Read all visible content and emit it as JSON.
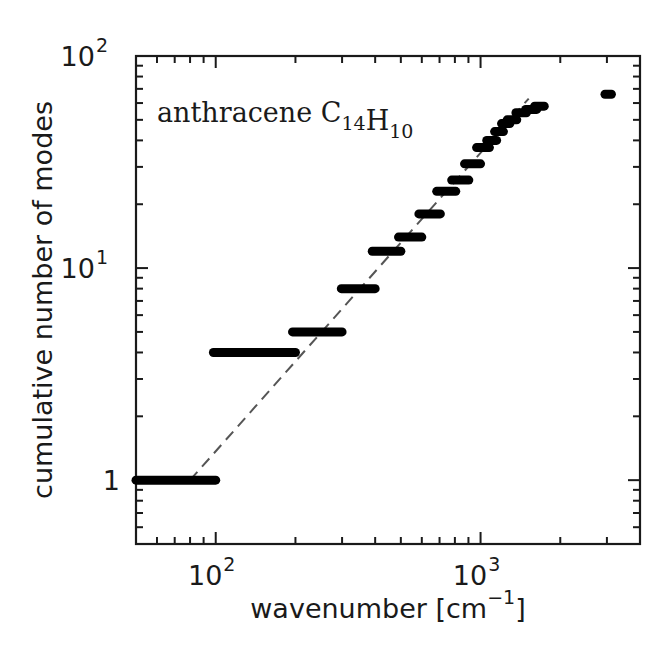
{
  "chart_data": {
    "type": "scatter",
    "title": "",
    "annotation": {
      "text": "anthracene",
      "formula": [
        {
          "t": "C",
          "sub": "14"
        },
        {
          "t": "H",
          "sub": "10"
        }
      ]
    },
    "xlabel": "wavenumber [cm⁻¹]",
    "xlabel_main": "wavenumber [cm",
    "xlabel_sup": "−1",
    "xlabel_close": "]",
    "ylabel": "cumulative number of modes",
    "xscale": "log",
    "yscale": "log",
    "xlim": [
      50,
      4000
    ],
    "ylim": [
      0.5,
      100
    ],
    "x_ticks": [
      {
        "value": 100,
        "base": "10",
        "exp": "2"
      },
      {
        "value": 1000,
        "base": "10",
        "exp": "3"
      }
    ],
    "y_ticks": [
      {
        "value": 1,
        "base": "1",
        "exp": ""
      },
      {
        "value": 10,
        "base": "10",
        "exp": "1"
      },
      {
        "value": 100,
        "base": "10",
        "exp": "2"
      }
    ],
    "grid": false,
    "legend": null,
    "series": [
      {
        "name": "cumulative modes (steps)",
        "style": "thick horizontal segments",
        "color": "#000000",
        "segments": [
          {
            "x0": 50,
            "x1": 100,
            "y": 1
          },
          {
            "x0": 98,
            "x1": 200,
            "y": 4
          },
          {
            "x0": 195,
            "x1": 300,
            "y": 5
          },
          {
            "x0": 298,
            "x1": 400,
            "y": 8
          },
          {
            "x0": 390,
            "x1": 500,
            "y": 12
          },
          {
            "x0": 490,
            "x1": 600,
            "y": 14
          },
          {
            "x0": 585,
            "x1": 705,
            "y": 18
          },
          {
            "x0": 683,
            "x1": 806,
            "y": 23
          },
          {
            "x0": 778,
            "x1": 903,
            "y": 26
          },
          {
            "x0": 870,
            "x1": 1000,
            "y": 31
          },
          {
            "x0": 966,
            "x1": 1080,
            "y": 37
          },
          {
            "x0": 1055,
            "x1": 1150,
            "y": 40
          },
          {
            "x0": 1130,
            "x1": 1220,
            "y": 44
          },
          {
            "x0": 1200,
            "x1": 1290,
            "y": 48
          },
          {
            "x0": 1260,
            "x1": 1370,
            "y": 50
          },
          {
            "x0": 1360,
            "x1": 1490,
            "y": 54
          },
          {
            "x0": 1480,
            "x1": 1630,
            "y": 56
          },
          {
            "x0": 1600,
            "x1": 1740,
            "y": 58
          },
          {
            "x0": 2950,
            "x1": 3120,
            "y": 66
          }
        ]
      },
      {
        "name": "power-law fit",
        "style": "dashed",
        "color": "#555555",
        "points": [
          {
            "x": 80,
            "y": 1
          },
          {
            "x": 1520,
            "y": 63
          }
        ]
      }
    ]
  }
}
